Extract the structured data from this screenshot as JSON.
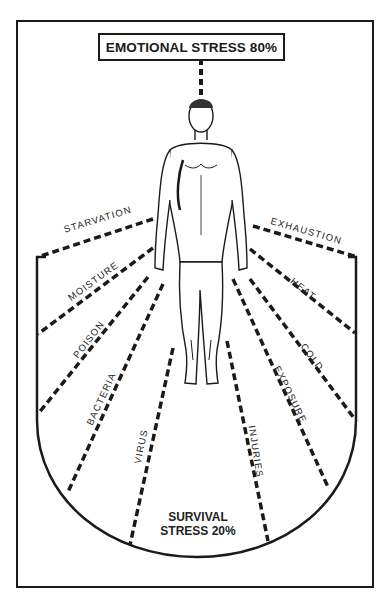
{
  "diagram": {
    "title": "EMOTIONAL STRESS 80%",
    "bottom_label_line1": "SURVIVAL",
    "bottom_label_line2": "STRESS 20%",
    "figure": "standing-human-figure",
    "stressors_left": [
      {
        "label": "STARVATION"
      },
      {
        "label": "MOISTURE"
      },
      {
        "label": "POISON"
      },
      {
        "label": "BACTERIA"
      },
      {
        "label": "VIRUS"
      }
    ],
    "stressors_right": [
      {
        "label": "EXHAUSTION"
      },
      {
        "label": "HEAT"
      },
      {
        "label": "COLD"
      },
      {
        "label": "EXPOSURE"
      },
      {
        "label": "INJURIES"
      }
    ],
    "colors": {
      "ink": "#1a1a1a",
      "paper": "#ffffff"
    }
  }
}
